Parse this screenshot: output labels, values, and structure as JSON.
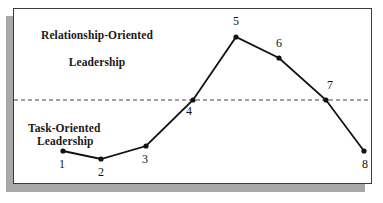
{
  "figure": {
    "background": "#ffffff",
    "frame_border_color": "#3a3a3a",
    "shadow_color": "#a8a8a8",
    "line_color": "#111111",
    "marker_color": "#111111",
    "divider_color": "#444444"
  },
  "labels": {
    "top_zone_line1": "Relationship-Oriented",
    "top_zone_line2": "Leadership",
    "bottom_zone_line1": "Task-Oriented",
    "bottom_zone_line2": "Leadership"
  },
  "chart_data": {
    "type": "line",
    "title": "",
    "subtitle": "",
    "xlabel": "",
    "ylabel": "",
    "grid": false,
    "legend": "none",
    "xlim": [
      0,
      9
    ],
    "ylim": [
      0,
      10
    ],
    "categories": [
      "1",
      "2",
      "3",
      "4",
      "5",
      "6",
      "7",
      "8"
    ],
    "series": [
      {
        "name": "Leadership emphasis",
        "values": [
          2.0,
          1.5,
          2.3,
          5.0,
          8.6,
          7.3,
          5.0,
          2.0
        ]
      }
    ],
    "point_labels": [
      "1",
      "2",
      "3",
      "4",
      "5",
      "6",
      "7",
      "8"
    ],
    "annotations": [
      {
        "text": "Relationship-Oriented Leadership",
        "position": "above-divider-left"
      },
      {
        "text": "Task-Oriented Leadership",
        "position": "below-divider-left"
      }
    ],
    "reference_line": {
      "orientation": "horizontal",
      "value": 5.0,
      "style": "dashed",
      "label": ""
    },
    "points_px": [
      {
        "label": "1",
        "x": 49,
        "y": 142,
        "lx": 45,
        "ly": 149
      },
      {
        "label": "2",
        "x": 87,
        "y": 150,
        "lx": 84,
        "ly": 157
      },
      {
        "label": "3",
        "x": 132,
        "y": 137,
        "lx": 128,
        "ly": 144
      },
      {
        "label": "4",
        "x": 179,
        "y": 91,
        "lx": 172,
        "ly": 96
      },
      {
        "label": "5",
        "x": 222,
        "y": 28,
        "lx": 219,
        "ly": 6
      },
      {
        "label": "6",
        "x": 265,
        "y": 49,
        "lx": 262,
        "ly": 28
      },
      {
        "label": "7",
        "x": 312,
        "y": 91,
        "lx": 313,
        "ly": 70
      },
      {
        "label": "8",
        "x": 350,
        "y": 142,
        "lx": 348,
        "ly": 149
      }
    ]
  }
}
